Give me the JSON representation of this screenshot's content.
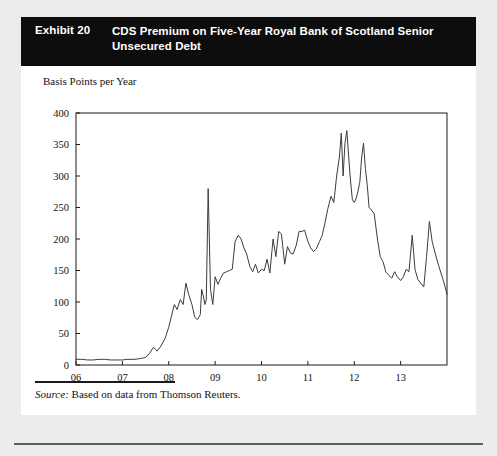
{
  "exhibit": {
    "number_label": "Exhibit 20",
    "title": "CDS Premium on Five-Year Royal Bank of Scotland Senior Unsecured Debt",
    "source_label": "Source:",
    "source_text": " Based on data from Thomson Reuters."
  },
  "colors": {
    "title_bar_background": "#0d0d0d",
    "title_text": "#ffffff",
    "card_background": "#ffffff",
    "page_background": "#ececed",
    "line": "#3c3c3c",
    "axis": "#1a1a1a",
    "bottom_rule": "#5b6066"
  },
  "chart_data": {
    "type": "line",
    "title": "CDS Premium on Five-Year Royal Bank of Scotland Senior Unsecured Debt",
    "subtitle": "",
    "xlabel": "",
    "ylabel": "Basis Points per Year",
    "ylim": [
      0,
      400
    ],
    "xlim": [
      2006.0,
      2014.0
    ],
    "grid": false,
    "legend": "none",
    "ytick_labels": [
      "0",
      "50",
      "100",
      "150",
      "200",
      "250",
      "300",
      "350",
      "400"
    ],
    "ytick_values": [
      0,
      50,
      100,
      150,
      200,
      250,
      300,
      350,
      400
    ],
    "xtick_labels": [
      "06",
      "07",
      "08",
      "09",
      "10",
      "11",
      "12",
      "13"
    ],
    "xtick_values": [
      2006,
      2007,
      2008,
      2009,
      2010,
      2011,
      2012,
      2013
    ],
    "series": [
      {
        "name": "CDS Premium on Five-Year RBS Senior Unsecured Debt",
        "x": [
          2006.0,
          2006.12,
          2006.25,
          2006.37,
          2006.5,
          2006.62,
          2006.75,
          2006.87,
          2007.0,
          2007.12,
          2007.25,
          2007.37,
          2007.5,
          2007.58,
          2007.67,
          2007.75,
          2007.83,
          2007.92,
          2008.0,
          2008.06,
          2008.12,
          2008.18,
          2008.25,
          2008.31,
          2008.37,
          2008.43,
          2008.5,
          2008.56,
          2008.62,
          2008.68,
          2008.71,
          2008.75,
          2008.78,
          2008.81,
          2008.85,
          2008.9,
          2008.95,
          2009.0,
          2009.06,
          2009.12,
          2009.18,
          2009.25,
          2009.31,
          2009.37,
          2009.43,
          2009.5,
          2009.56,
          2009.62,
          2009.68,
          2009.75,
          2009.81,
          2009.87,
          2009.93,
          2010.0,
          2010.06,
          2010.12,
          2010.18,
          2010.25,
          2010.31,
          2010.37,
          2010.43,
          2010.5,
          2010.56,
          2010.62,
          2010.68,
          2010.75,
          2010.81,
          2010.87,
          2010.93,
          2011.0,
          2011.06,
          2011.12,
          2011.18,
          2011.25,
          2011.31,
          2011.37,
          2011.43,
          2011.5,
          2011.56,
          2011.62,
          2011.68,
          2011.72,
          2011.76,
          2011.8,
          2011.84,
          2011.88,
          2011.92,
          2011.96,
          2012.0,
          2012.04,
          2012.08,
          2012.12,
          2012.16,
          2012.2,
          2012.24,
          2012.28,
          2012.32,
          2012.37,
          2012.43,
          2012.5,
          2012.56,
          2012.62,
          2012.68,
          2012.75,
          2012.81,
          2012.87,
          2012.93,
          2013.0,
          2013.06,
          2013.12,
          2013.18,
          2013.25,
          2013.31,
          2013.37,
          2013.43,
          2013.5,
          2013.56,
          2013.62,
          2013.68,
          2013.75,
          2013.81,
          2013.87,
          2013.93,
          2014.0
        ],
        "y": [
          9,
          9,
          8,
          8,
          9,
          9,
          8,
          8,
          8,
          9,
          9,
          10,
          12,
          18,
          28,
          22,
          30,
          42,
          60,
          78,
          96,
          88,
          104,
          96,
          130,
          112,
          96,
          76,
          72,
          80,
          120,
          108,
          96,
          104,
          280,
          120,
          96,
          140,
          128,
          138,
          146,
          148,
          150,
          152,
          196,
          206,
          200,
          186,
          176,
          156,
          148,
          160,
          146,
          152,
          150,
          168,
          146,
          200,
          172,
          212,
          208,
          160,
          188,
          178,
          176,
          190,
          212,
          212,
          214,
          196,
          186,
          180,
          184,
          196,
          206,
          226,
          248,
          268,
          258,
          300,
          330,
          368,
          300,
          352,
          372,
          330,
          292,
          262,
          258,
          264,
          276,
          290,
          330,
          352,
          312,
          286,
          250,
          246,
          240,
          200,
          172,
          164,
          148,
          142,
          138,
          148,
          140,
          134,
          140,
          152,
          148,
          206,
          152,
          136,
          130,
          124,
          172,
          228,
          196,
          176,
          160,
          146,
          132,
          112
        ]
      }
    ]
  }
}
